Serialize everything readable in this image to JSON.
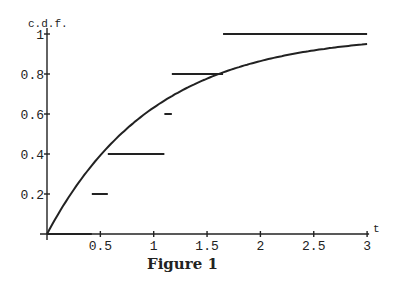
{
  "caption": "Figure 1",
  "chart_data": {
    "type": "line",
    "title": "Figure 1",
    "xlabel": "t",
    "ylabel": "c.d.f.",
    "xlim": [
      0,
      3
    ],
    "ylim": [
      0,
      1
    ],
    "x_ticks": [
      "0.5",
      "1",
      "1.5",
      "2",
      "2.5",
      "3"
    ],
    "y_ticks": [
      "0.2",
      "0.4",
      "0.6",
      "0.8",
      "1"
    ],
    "grid": false,
    "series": [
      {
        "name": "empirical c.d.f. (step)",
        "segments": [
          {
            "x0": 0,
            "x1": 0.42,
            "y": 0
          },
          {
            "x0": 0.42,
            "x1": 0.57,
            "y": 0.2
          },
          {
            "x0": 0.57,
            "x1": 1.1,
            "y": 0.4
          },
          {
            "x0": 1.1,
            "x1": 1.17,
            "y": 0.6
          },
          {
            "x0": 1.17,
            "x1": 1.65,
            "y": 0.8
          },
          {
            "x0": 1.65,
            "x1": 3.0,
            "y": 1.0
          }
        ]
      },
      {
        "name": "theoretical c.d.f. 1 - exp(-t)",
        "x": [
          0,
          0.25,
          0.5,
          0.75,
          1.0,
          1.25,
          1.5,
          1.75,
          2.0,
          2.5,
          3.0
        ],
        "values": [
          0,
          0.221,
          0.393,
          0.528,
          0.632,
          0.713,
          0.777,
          0.826,
          0.865,
          0.918,
          0.95
        ]
      }
    ]
  }
}
